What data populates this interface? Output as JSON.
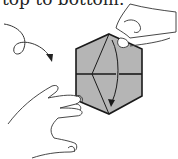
{
  "caption": "top to bottom.",
  "figure": {
    "colors": {
      "paper": "#b5b5b5",
      "line": "#1a1a1a",
      "background": "#ffffff"
    }
  }
}
